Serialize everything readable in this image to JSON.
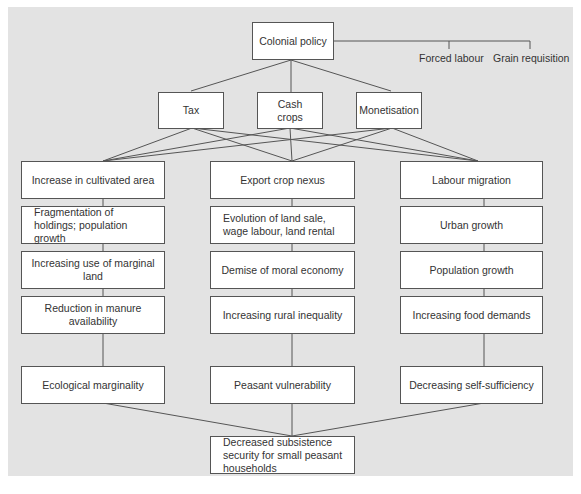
{
  "diagram": {
    "root": "Colonial policy",
    "side_labels": [
      "Forced labour",
      "Grain requisition"
    ],
    "mechanisms": [
      "Tax",
      "Cash crops",
      "Monetisation"
    ],
    "columns": [
      {
        "items": [
          "Increase in cultivated area",
          "Fragmentation of holdings; population growth",
          "Increasing use of marginal land",
          "Reduction in manure availability"
        ],
        "outcome": "Ecological marginality"
      },
      {
        "items": [
          "Export crop nexus",
          "Evolution of land sale, wage labour, land rental",
          "Demise of moral economy",
          "Increasing rural inequality"
        ],
        "outcome": "Peasant vulnerability"
      },
      {
        "items": [
          "Labour migration",
          "Urban growth",
          "Population growth",
          "Increasing food demands"
        ],
        "outcome": "Decreasing self-sufficiency"
      }
    ],
    "final": "Decreased subsistence security for small peasant households"
  }
}
